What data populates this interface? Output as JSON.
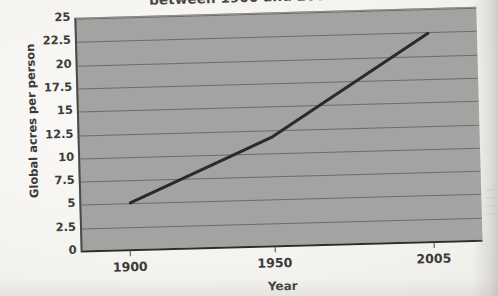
{
  "document": {
    "title_fragment": "between 1900 and 2005",
    "title_note": "title is clipped by the top edge of the screenshot"
  },
  "chart_data": {
    "type": "line",
    "title": "between 1900 and 2005",
    "xlabel": "Year",
    "ylabel": "Global acres per person",
    "x": [
      1900,
      1950,
      2005
    ],
    "values": [
      5,
      11.7,
      22.4
    ],
    "series": [
      {
        "name": "Global acres per person",
        "values": [
          5,
          11.7,
          22.4
        ]
      }
    ],
    "xticklabels": [
      "1900",
      "1950",
      "2005"
    ],
    "yticklabels": [
      "0",
      "2.5",
      "5",
      "7.5",
      "10",
      "12.5",
      "15",
      "17.5",
      "20",
      "22.5",
      "25"
    ],
    "ytickvalues": [
      0,
      2.5,
      5,
      7.5,
      10,
      12.5,
      15,
      17.5,
      20,
      22.5,
      25
    ],
    "xlim": [
      1883,
      2022
    ],
    "ylim": [
      0,
      25
    ],
    "grid": true,
    "grid_axis": "y",
    "legend": false,
    "plot_background": "#a3a3a1",
    "line_color": "#2b2a29",
    "line_width": 3,
    "page_background": "#f4f3f0"
  },
  "axes": {
    "y": {
      "title": "Global acres per person",
      "ticks": [
        {
          "label": "25",
          "value": 25
        },
        {
          "label": "22.5",
          "value": 22.5
        },
        {
          "label": "20",
          "value": 20
        },
        {
          "label": "17.5",
          "value": 17.5
        },
        {
          "label": "15",
          "value": 15
        },
        {
          "label": "12.5",
          "value": 12.5
        },
        {
          "label": "10",
          "value": 10
        },
        {
          "label": "7.5",
          "value": 7.5
        },
        {
          "label": "5",
          "value": 5
        },
        {
          "label": "2.5",
          "value": 2.5
        },
        {
          "label": "0",
          "value": 0
        }
      ]
    },
    "x": {
      "title": "Year",
      "ticks": [
        {
          "label": "1900",
          "value": 1900
        },
        {
          "label": "1950",
          "value": 1950
        },
        {
          "label": "2005",
          "value": 2005
        }
      ]
    }
  }
}
